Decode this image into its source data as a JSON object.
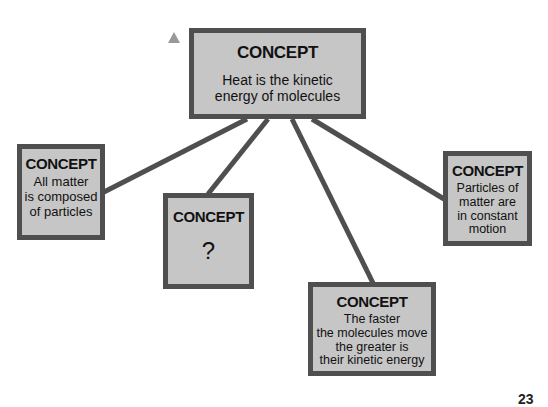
{
  "diagram": {
    "marker": "triangle-icon",
    "nodes": {
      "top": {
        "title": "CONCEPT",
        "text": "Heat is the kinetic energy of molecules"
      },
      "left": {
        "title": "CONCEPT",
        "text": "All matter is composed of particles"
      },
      "question": {
        "title": "CONCEPT",
        "text": "?"
      },
      "bottom": {
        "title": "CONCEPT",
        "text": "The faster the molecules move the greater is their kinetic energy"
      },
      "right": {
        "title": "CONCEPT",
        "text": "Particles of matter are in constant motion"
      }
    },
    "edges": [
      {
        "from": "top",
        "to": "left"
      },
      {
        "from": "top",
        "to": "question"
      },
      {
        "from": "top",
        "to": "bottom"
      },
      {
        "from": "top",
        "to": "right"
      }
    ],
    "colors": {
      "box_fill": "#c6c6c6",
      "box_border": "#4f4f4f",
      "link": "#4f4f4f"
    },
    "page_number": "23"
  }
}
